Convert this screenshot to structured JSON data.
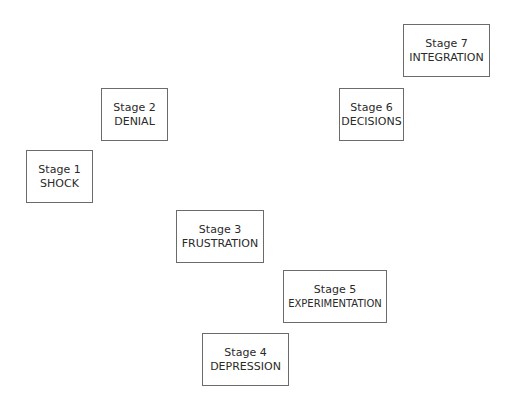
{
  "diagram": {
    "stages": [
      {
        "label": "Stage 1",
        "name": "SHOCK"
      },
      {
        "label": "Stage 2",
        "name": "DENIAL"
      },
      {
        "label": "Stage 3",
        "name": "FRUSTRATION"
      },
      {
        "label": "Stage 4",
        "name": "DEPRESSION"
      },
      {
        "label": "Stage 5",
        "name": "EXPERIMENTATION"
      },
      {
        "label": "Stage 6",
        "name": "DECISIONS"
      },
      {
        "label": "Stage 7",
        "name": "INTEGRATION"
      }
    ]
  }
}
